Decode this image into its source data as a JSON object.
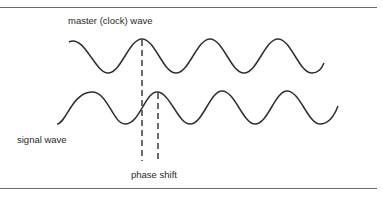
{
  "diagram": {
    "labels": {
      "master": "master (clock) wave",
      "signal": "signal wave",
      "phase_shift": "phase shift"
    },
    "colors": {
      "stroke": "#2f2f2f",
      "rule": "#6a6a6a",
      "background": "#ffffff"
    }
  }
}
